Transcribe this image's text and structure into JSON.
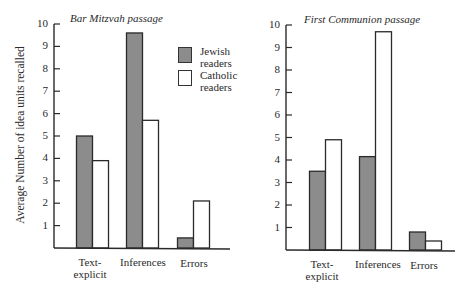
{
  "chart_data": [
    {
      "type": "bar",
      "title": "Bar Mitzvah passage",
      "xlabel": "",
      "ylabel": "Average Number of idea units recalled",
      "ylim": [
        0,
        10
      ],
      "yticks": [
        1,
        2,
        3,
        4,
        5,
        6,
        7,
        8,
        9,
        10
      ],
      "categories": [
        "Text-explicit",
        "Inferences",
        "Errors"
      ],
      "series": [
        {
          "name": "Jewish readers",
          "color": "#8c8c8c",
          "values": [
            5.0,
            9.6,
            0.45
          ]
        },
        {
          "name": "Catholic readers",
          "color": "#ffffff",
          "values": [
            3.9,
            5.7,
            2.1
          ]
        }
      ],
      "legend_position": "upper right",
      "grid": false
    },
    {
      "type": "bar",
      "title": "First Communion passage",
      "xlabel": "",
      "ylabel": "",
      "ylim": [
        0,
        10
      ],
      "yticks": [
        1,
        2,
        3,
        4,
        5,
        6,
        7,
        8,
        9,
        10
      ],
      "categories": [
        "Text-explicit",
        "Inferences",
        "Errors"
      ],
      "series": [
        {
          "name": "Jewish readers",
          "color": "#8c8c8c",
          "values": [
            3.5,
            4.15,
            0.8
          ]
        },
        {
          "name": "Catholic readers",
          "color": "#ffffff",
          "values": [
            4.9,
            9.7,
            0.4
          ]
        }
      ],
      "grid": false
    }
  ],
  "labels": {
    "ylabel": "Average Number of idea units recalled",
    "left_title": "Bar Mitzvah passage",
    "right_title": "First Communion passage",
    "cat_text_explicit_line1": "Text-",
    "cat_text_explicit_line2": "explicit",
    "cat_inferences": "Inferences",
    "cat_errors": "Errors",
    "legend_jewish_line1": "Jewish",
    "legend_jewish_line2": "readers",
    "legend_catholic_line1": "Catholic",
    "legend_catholic_line2": "readers",
    "ticks": [
      "1",
      "2",
      "3",
      "4",
      "5",
      "6",
      "7",
      "8",
      "9",
      "10"
    ]
  }
}
